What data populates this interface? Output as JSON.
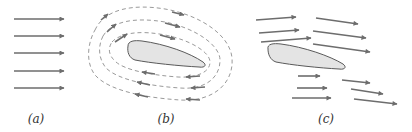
{
  "figure": {
    "colors": {
      "arrow": "#6d6d6d",
      "streamline": "#9a9a9a",
      "airfoil_fill": "#e4e4e4",
      "airfoil_stroke": "#5a5a5a",
      "label": "#333333"
    },
    "panels": [
      {
        "id": "a",
        "label": "(a)",
        "title": "Uniform flow",
        "arrow_count": 5,
        "arrow_direction": "right"
      },
      {
        "id": "b",
        "label": "(b)",
        "title": "Circulation around airfoil",
        "streamline_count": 3,
        "circulation_direction": "clockwise",
        "has_airfoil": true
      },
      {
        "id": "c",
        "label": "(c)",
        "title": "Combined flow",
        "arrow_count": 12,
        "has_airfoil": true,
        "note": "Flow above airfoil has longer arrows (faster) than flow below"
      }
    ]
  }
}
